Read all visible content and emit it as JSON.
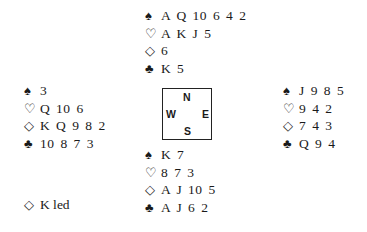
{
  "deal": {
    "north": {
      "spades": "A Q 10 6 4 2",
      "hearts": "A K J 5",
      "diamonds": "6",
      "clubs": "K 5"
    },
    "west": {
      "spades": "3",
      "hearts": "Q 10 6",
      "diamonds": "K Q 9 8 2",
      "clubs": "10 8 7 3"
    },
    "east": {
      "spades": "J 9 8 5",
      "hearts": "9 4 2",
      "diamonds": "7 4 3",
      "clubs": "Q 9 4"
    },
    "south": {
      "spades": "K 7",
      "hearts": "8 7 3",
      "diamonds": "A J 10 5",
      "clubs": "A J 6 2"
    }
  },
  "symbols": {
    "spades": "♠",
    "hearts": "♡",
    "diamonds": "◇",
    "clubs": "♣"
  },
  "compass": {
    "n": "N",
    "e": "E",
    "s": "S",
    "w": "W"
  },
  "lead": {
    "suit": "◇",
    "text": "K led"
  }
}
